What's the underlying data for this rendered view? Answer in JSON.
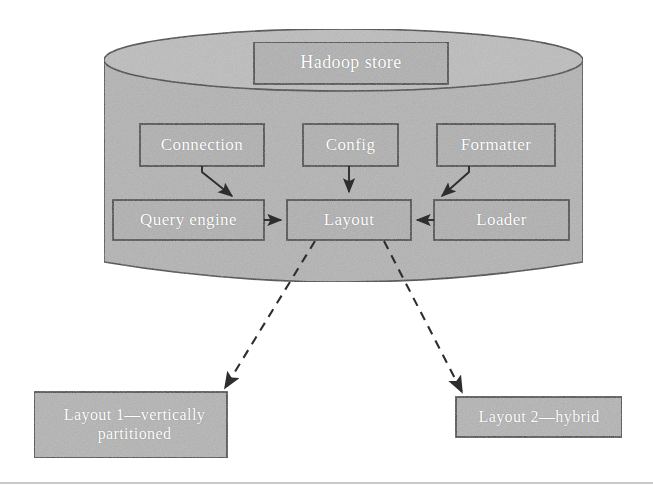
{
  "figure": {
    "width": 653,
    "height": 489,
    "background": "#ffffff"
  },
  "colors": {
    "cylinder_fill": "#b3b3b3",
    "cylinder_top_fill": "#bdbdbd",
    "box_fill": "#b0b0b0",
    "box_fill_outer": "#b4b4b4",
    "stroke": "#3a3a3a",
    "label_text": "#ffffff",
    "rule": "#c9c9c9"
  },
  "container": {
    "name": "hadoop-store-cylinder",
    "shape": "cylinder"
  },
  "nodes": [
    {
      "id": "hadoop-store",
      "label": "Hadoop store",
      "x": 254,
      "y": 42,
      "w": 194,
      "h": 42,
      "font_size": 18,
      "inside_cylinder": true
    },
    {
      "id": "connection",
      "label": "Connection",
      "x": 140,
      "y": 124,
      "w": 124,
      "h": 42,
      "font_size": 17,
      "inside_cylinder": true
    },
    {
      "id": "config",
      "label": "Config",
      "x": 303,
      "y": 124,
      "w": 95,
      "h": 42,
      "font_size": 17,
      "inside_cylinder": true
    },
    {
      "id": "formatter",
      "label": "Formatter",
      "x": 437,
      "y": 124,
      "w": 118,
      "h": 42,
      "font_size": 17,
      "inside_cylinder": true
    },
    {
      "id": "query-engine",
      "label": "Query engine",
      "x": 113,
      "y": 200,
      "w": 151,
      "h": 40,
      "font_size": 17,
      "inside_cylinder": true
    },
    {
      "id": "layout",
      "label": "Layout",
      "x": 287,
      "y": 200,
      "w": 124,
      "h": 40,
      "font_size": 17,
      "inside_cylinder": true
    },
    {
      "id": "loader",
      "label": "Loader",
      "x": 434,
      "y": 200,
      "w": 135,
      "h": 40,
      "font_size": 17,
      "inside_cylinder": true
    },
    {
      "id": "layout-1",
      "label": "Layout 1—vertically partitioned",
      "x": 34,
      "y": 392,
      "w": 193,
      "h": 66,
      "font_size": 16,
      "inside_cylinder": false
    },
    {
      "id": "layout-2",
      "label": "Layout 2—hybrid",
      "x": 456,
      "y": 397,
      "w": 166,
      "h": 40,
      "font_size": 16,
      "inside_cylinder": false
    }
  ],
  "edges": [
    {
      "id": "connection-to-layout",
      "from": "connection",
      "to": "layout",
      "style": "solid",
      "arrow": true
    },
    {
      "id": "config-to-layout",
      "from": "config",
      "to": "layout",
      "style": "solid",
      "arrow": true
    },
    {
      "id": "formatter-to-layout",
      "from": "formatter",
      "to": "layout",
      "style": "solid",
      "arrow": true
    },
    {
      "id": "query-engine-to-layout",
      "from": "query-engine",
      "to": "layout",
      "style": "solid",
      "arrow": true
    },
    {
      "id": "loader-to-layout",
      "from": "loader",
      "to": "layout",
      "style": "solid",
      "arrow": true
    },
    {
      "id": "layout-to-layout-1",
      "from": "layout",
      "to": "layout-1",
      "style": "dashed",
      "arrow": true
    },
    {
      "id": "layout-to-layout-2",
      "from": "layout",
      "to": "layout-2",
      "style": "dashed",
      "arrow": true
    }
  ]
}
